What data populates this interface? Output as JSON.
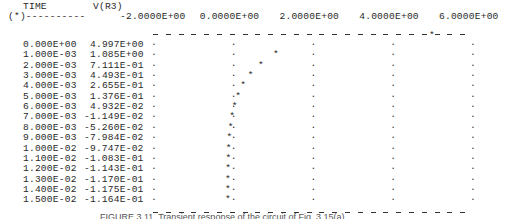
{
  "header": {
    "col1_label": "TIME",
    "col2_label": "V(R3)",
    "col1_sub": "(*)----------",
    "ticks": [
      "-2.0000E+00",
      "0.0000E+00",
      "2.0000E+00",
      "4.0000E+00",
      "6.0000E+00"
    ]
  },
  "rows": [
    {
      "time": "0.000E+00",
      "v": "4.997E+00"
    },
    {
      "time": "1.000E-03",
      "v": "1.085E+00"
    },
    {
      "time": "2.000E-03",
      "v": "7.111E-01"
    },
    {
      "time": "3.000E-03",
      "v": "4.493E-01"
    },
    {
      "time": "4.000E-03",
      "v": "2.655E-01"
    },
    {
      "time": "5.000E-03",
      "v": "1.376E-01"
    },
    {
      "time": "6.000E-03",
      "v": "4.932E-02"
    },
    {
      "time": "7.000E-03",
      "v": "-1.149E-02"
    },
    {
      "time": "8.000E-03",
      "v": "-5.260E-02"
    },
    {
      "time": "9.000E-03",
      "v": "-7.984E-02"
    },
    {
      "time": "1.000E-02",
      "v": "-9.747E-02"
    },
    {
      "time": "1.100E-02",
      "v": "-1.083E-01"
    },
    {
      "time": "1.200E-02",
      "v": "-1.143E-01"
    },
    {
      "time": "1.300E-02",
      "v": "-1.170E-01"
    },
    {
      "time": "1.400E-02",
      "v": "-1.175E-01"
    },
    {
      "time": "1.500E-02",
      "v": "-1.164E-01"
    }
  ],
  "caption": "FIGURE 3.11  Transient response of the circuit of Fig. 3.15(a)",
  "chart_data": {
    "type": "line",
    "title": "",
    "xlabel": "TIME",
    "ylabel": "V(R3)",
    "x": [
      0.0,
      0.001,
      0.002,
      0.003,
      0.004,
      0.005,
      0.006,
      0.007,
      0.008,
      0.009,
      0.01,
      0.011,
      0.012,
      0.013,
      0.014,
      0.015
    ],
    "series": [
      {
        "name": "V(R3)",
        "values": [
          4.997,
          1.085,
          0.7111,
          0.4493,
          0.2655,
          0.1376,
          0.04932,
          -0.01149,
          -0.0526,
          -0.07984,
          -0.09747,
          -0.1083,
          -0.1143,
          -0.117,
          -0.1175,
          -0.1164
        ]
      }
    ],
    "value_axis_range": [
      -2.0,
      6.0
    ],
    "value_axis_ticks": [
      -2.0,
      0.0,
      2.0,
      4.0,
      6.0
    ],
    "orientation": "time runs downward, value plotted horizontally (SPICE ASCII plot)",
    "marker": "*",
    "grid": true
  }
}
